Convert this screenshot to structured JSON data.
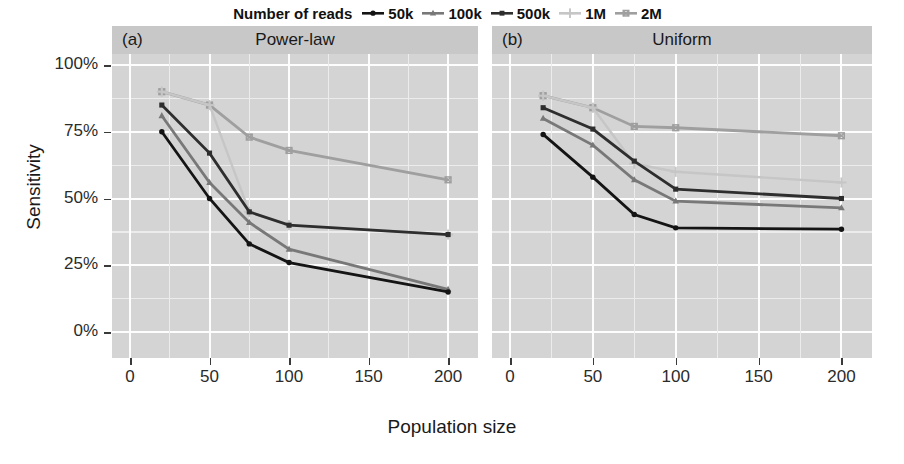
{
  "legend": {
    "title": "Number of reads",
    "entries": [
      {
        "label": "50k",
        "marker": "circle-marker",
        "color": "#141414"
      },
      {
        "label": "100k",
        "marker": "triangle-marker",
        "color": "#787878"
      },
      {
        "label": "500k",
        "marker": "square-marker",
        "color": "#2e2e2e"
      },
      {
        "label": "1M",
        "marker": "plus-marker",
        "color": "#c6c6c6"
      },
      {
        "label": "2M",
        "marker": "crossed-square-marker",
        "color": "#9f9f9f"
      }
    ]
  },
  "axes": {
    "ylabel": "Sensitivity",
    "xlabel": "Population size",
    "yticks": [
      "0%",
      "25%",
      "50%",
      "75%",
      "100%"
    ],
    "ytick_values": [
      0,
      25,
      50,
      75,
      100
    ],
    "xticks": [
      "0",
      "50",
      "100",
      "150",
      "200"
    ],
    "xtick_values": [
      0,
      50,
      100,
      150,
      200
    ]
  },
  "panels": [
    {
      "tag": "(a)",
      "title": "Power-law"
    },
    {
      "tag": "(b)",
      "title": "Uniform"
    }
  ],
  "chart_data": [
    {
      "type": "line",
      "title": "Power-law",
      "panel_tag": "(a)",
      "xlabel": "Population size",
      "ylabel": "Sensitivity",
      "xlim": [
        0,
        210
      ],
      "ylim": [
        0,
        100
      ],
      "grid": true,
      "legend_position": "top-center",
      "legend_title": "Number of reads",
      "x": [
        20,
        50,
        75,
        100,
        200
      ],
      "series": [
        {
          "name": "50k",
          "marker": "circle-marker",
          "color": "#141414",
          "values": [
            75,
            50,
            33,
            26,
            15
          ]
        },
        {
          "name": "100k",
          "marker": "triangle-marker",
          "color": "#787878",
          "values": [
            81,
            56,
            41,
            31,
            16
          ]
        },
        {
          "name": "500k",
          "marker": "square-marker",
          "color": "#2e2e2e",
          "values": [
            85,
            67,
            45,
            40,
            36.5
          ]
        },
        {
          "name": "1M",
          "marker": "plus-marker",
          "color": "#c6c6c6",
          "values": [
            90,
            85,
            45,
            40,
            36.5
          ]
        },
        {
          "name": "2M",
          "marker": "crossed-square-marker",
          "color": "#9f9f9f",
          "values": [
            90,
            85,
            73,
            68,
            57
          ]
        }
      ]
    },
    {
      "type": "line",
      "title": "Uniform",
      "panel_tag": "(b)",
      "xlabel": "Population size",
      "ylabel": "Sensitivity",
      "xlim": [
        0,
        210
      ],
      "ylim": [
        0,
        100
      ],
      "grid": true,
      "legend_position": "top-center",
      "legend_title": "Number of reads",
      "x": [
        20,
        50,
        75,
        100,
        200
      ],
      "series": [
        {
          "name": "50k",
          "marker": "circle-marker",
          "color": "#141414",
          "values": [
            74,
            58,
            44,
            39,
            38.5
          ]
        },
        {
          "name": "100k",
          "marker": "triangle-marker",
          "color": "#787878",
          "values": [
            80,
            70,
            57,
            49,
            46.5
          ]
        },
        {
          "name": "500k",
          "marker": "square-marker",
          "color": "#2e2e2e",
          "values": [
            84,
            76,
            64,
            53.5,
            50
          ]
        },
        {
          "name": "1M",
          "marker": "plus-marker",
          "color": "#c6c6c6",
          "values": [
            88.5,
            84,
            63,
            60,
            56
          ]
        },
        {
          "name": "2M",
          "marker": "crossed-square-marker",
          "color": "#9f9f9f",
          "values": [
            88.5,
            84,
            77,
            76.5,
            73.5
          ]
        }
      ]
    }
  ]
}
